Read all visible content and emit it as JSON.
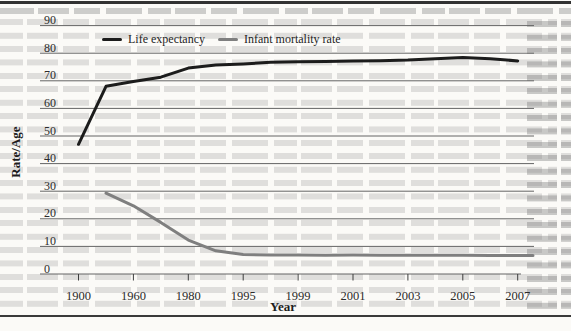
{
  "figure": {
    "kind": "scanned book figure",
    "legend": {
      "position": "top-center"
    }
  },
  "chart_data": {
    "type": "line",
    "title": "",
    "xlabel": "Year",
    "ylabel": "Rate/Age",
    "ylim": [
      0,
      90
    ],
    "grid": "horizontal",
    "legend_position": "top",
    "categories": [
      1900,
      1950,
      1960,
      1970,
      1980,
      1990,
      1995,
      1997,
      1999,
      2000,
      2001,
      2002,
      2003,
      2004,
      2005,
      2006,
      2007
    ],
    "xticks": [
      1900,
      1960,
      1980,
      1995,
      1999,
      2001,
      2003,
      2005,
      2007
    ],
    "yticks": [
      0,
      10,
      20,
      30,
      40,
      50,
      60,
      70,
      80,
      90
    ],
    "series": [
      {
        "name": "Life expectancy",
        "color": "#1c1c1c",
        "values": [
          47,
          68,
          69.8,
          71.3,
          74.6,
          75.7,
          76.1,
          76.7,
          76.9,
          77.0,
          77.2,
          77.3,
          77.5,
          78.0,
          78.4,
          78.0,
          77.2
        ],
        "extends_to_plot_edge": false
      },
      {
        "name": "Infant mortality rate",
        "color": "#7f7f7f",
        "values": [
          null,
          29.3,
          24.7,
          18.7,
          12.3,
          8.4,
          7.1,
          6.9,
          6.9,
          6.8,
          6.9,
          6.8,
          6.8,
          6.8,
          6.8,
          6.7,
          6.7
        ],
        "extends_to_plot_edge": true
      }
    ]
  }
}
